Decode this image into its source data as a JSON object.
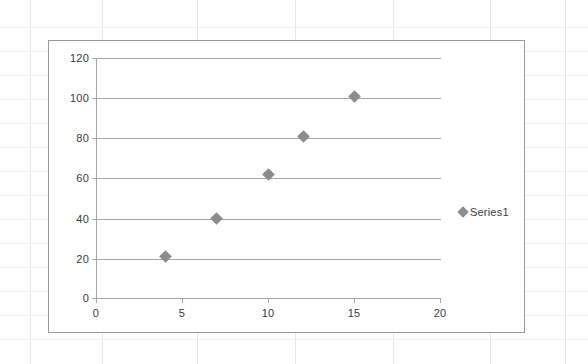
{
  "chart_data": {
    "type": "scatter",
    "title": "",
    "xlabel": "",
    "ylabel": "",
    "xlim": [
      0,
      20
    ],
    "ylim": [
      0,
      120
    ],
    "x_ticks": [
      0,
      5,
      10,
      15,
      20
    ],
    "y_ticks": [
      0,
      20,
      40,
      60,
      80,
      100,
      120
    ],
    "grid": "horizontal",
    "legend_position": "right",
    "series": [
      {
        "name": "Series1",
        "marker": "diamond",
        "color": "#8c8c8c",
        "points": [
          {
            "x": 4,
            "y": 21
          },
          {
            "x": 7,
            "y": 40
          },
          {
            "x": 10,
            "y": 62
          },
          {
            "x": 12,
            "y": 81
          },
          {
            "x": 15,
            "y": 101
          }
        ]
      }
    ]
  },
  "legend": {
    "entries": [
      {
        "label": "Series1"
      }
    ]
  },
  "axes": {
    "y_tick_labels": [
      "120",
      "100",
      "80",
      "60",
      "40",
      "20",
      "0"
    ],
    "x_tick_labels": [
      "0",
      "5",
      "10",
      "15",
      "20"
    ]
  },
  "colors": {
    "marker": "#8c8c8c",
    "gridline": "#a6a6a6",
    "axis": "#a6a6a6",
    "chart_border": "#9a9a9a",
    "sheet_gridline": "#e6e6e6",
    "text": "#3b3b3b",
    "background": "#ffffff"
  }
}
